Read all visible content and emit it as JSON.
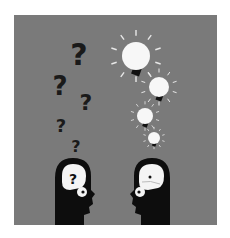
{
  "illustration": {
    "title": "Questions vs. ideas",
    "background_color": "#7a7a7a",
    "frame_color": "#ffffff",
    "left_head": {
      "label": "confused-head",
      "thought_symbol": "?",
      "question_marks": [
        {
          "x": 79,
          "y": 65,
          "size": 30
        },
        {
          "x": 60,
          "y": 95,
          "size": 26
        },
        {
          "x": 86,
          "y": 110,
          "size": 22
        },
        {
          "x": 61,
          "y": 132,
          "size": 18
        },
        {
          "x": 76,
          "y": 152,
          "size": 16
        }
      ]
    },
    "right_head": {
      "label": "idea-head",
      "lightbulbs": [
        {
          "x": 136,
          "y": 56,
          "r": 14
        },
        {
          "x": 159,
          "y": 87,
          "r": 10
        },
        {
          "x": 145,
          "y": 116,
          "r": 8
        },
        {
          "x": 154,
          "y": 138,
          "r": 6
        }
      ]
    },
    "colors": {
      "silhouette": "#0d0d0d",
      "glyph": "#1a1a1a",
      "bulb": "#f7f7f7",
      "ray": "#e8e8e8"
    }
  }
}
